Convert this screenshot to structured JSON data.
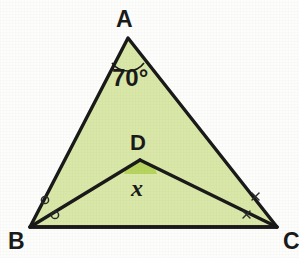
{
  "figure": {
    "background_color": "#fdfdfb",
    "fill_color": "#d9e8a8",
    "arc_fill_color": "#b7d45f",
    "stroke_color": "#1a1a1a",
    "width": 299,
    "height": 258
  },
  "labels": {
    "vertex_a": "A",
    "vertex_b": "B",
    "vertex_c": "C",
    "vertex_d": "D",
    "angle_a": "70°",
    "angle_d": "x"
  },
  "points": {
    "A": {
      "x": 128,
      "y": 38
    },
    "B": {
      "x": 30,
      "y": 227
    },
    "C": {
      "x": 277,
      "y": 227
    },
    "D": {
      "x": 140,
      "y": 160
    }
  },
  "segments": [
    {
      "name": "AB",
      "from": "A",
      "to": "B"
    },
    {
      "name": "AC",
      "from": "A",
      "to": "C"
    },
    {
      "name": "BC",
      "from": "B",
      "to": "C"
    },
    {
      "name": "BD",
      "from": "B",
      "to": "D"
    },
    {
      "name": "DC",
      "from": "D",
      "to": "C"
    }
  ],
  "angle_marks": {
    "a_arc": {
      "at": "A",
      "value": "70°",
      "style": "single-arc"
    },
    "d_arc": {
      "at": "D",
      "value": "x",
      "style": "filled-arc"
    },
    "b_marks": {
      "at": "B",
      "glyph": "circle",
      "count": 2,
      "meaning": "equal angles"
    },
    "c_marks": {
      "at": "C",
      "glyph": "cross",
      "count": 2,
      "meaning": "equal angles"
    }
  }
}
